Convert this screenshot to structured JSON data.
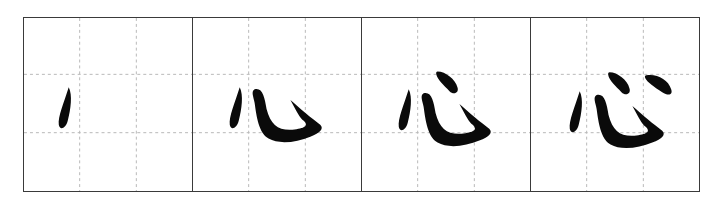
{
  "diagram": {
    "type": "stroke-order",
    "character": "心",
    "grid": {
      "rows": 3,
      "cols": 3,
      "guide_style": "dashed",
      "guide_color": "#b8b8b8",
      "border_color": "#3a3a3a"
    },
    "ink_color": "#0a0a0a",
    "steps": [
      {
        "step": 1,
        "strokes_shown": 1,
        "stroke_names": [
          "点"
        ]
      },
      {
        "step": 2,
        "strokes_shown": 2,
        "stroke_names": [
          "点",
          "卧钩"
        ]
      },
      {
        "step": 3,
        "strokes_shown": 3,
        "stroke_names": [
          "点",
          "卧钩",
          "点"
        ]
      },
      {
        "step": 4,
        "strokes_shown": 4,
        "stroke_names": [
          "点",
          "卧钩",
          "点",
          "点"
        ]
      }
    ]
  }
}
